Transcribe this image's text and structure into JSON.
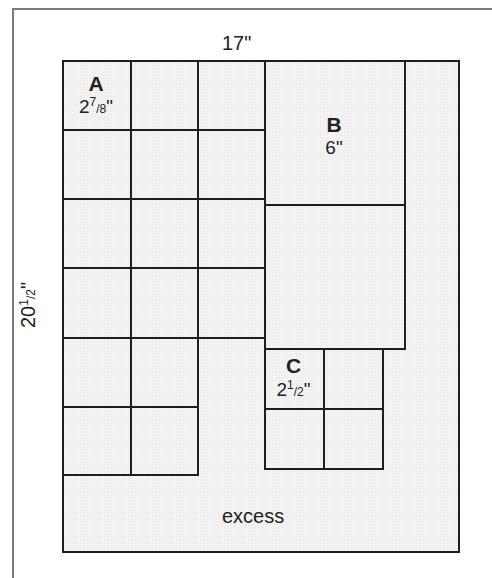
{
  "diagram": {
    "width_label": "17\"",
    "height_label_whole": "20",
    "height_label_num": "1",
    "height_label_den": "2",
    "height_label_unit": "\"",
    "excess_label": "excess",
    "pieces": {
      "A": {
        "letter": "A",
        "whole": "2",
        "num": "7",
        "den": "8",
        "unit": "\"",
        "count": 16
      },
      "B": {
        "letter": "B",
        "size": "6\"",
        "count": 2
      },
      "C": {
        "letter": "C",
        "whole": "2",
        "num": "1",
        "den": "2",
        "unit": "\"",
        "count": 4
      }
    },
    "colors": {
      "sheet": "#eeeeee",
      "line": "#1e1e1e",
      "frame": "#7a7a7a"
    }
  }
}
